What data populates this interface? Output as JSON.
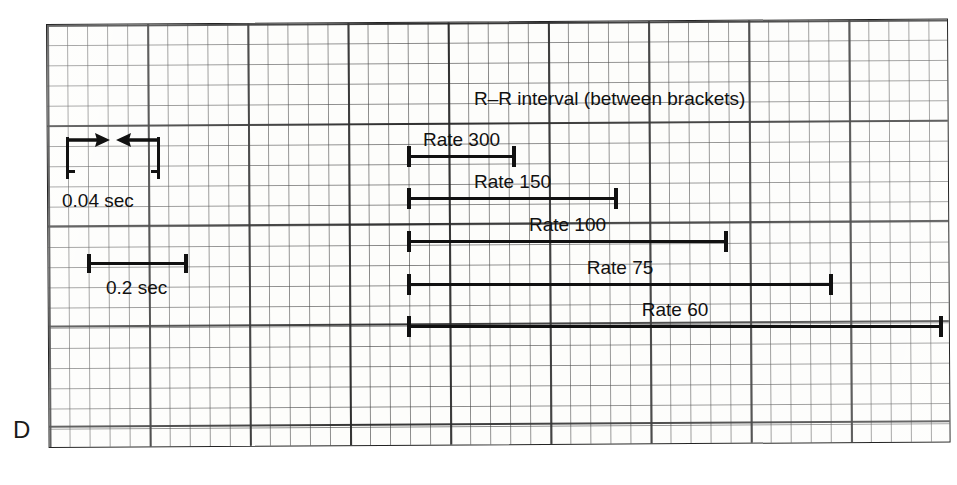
{
  "figure": {
    "panel_letter": "D",
    "title": "R–R interval (between brackets)",
    "background_color": "#ffffff",
    "ink_color": "#111111",
    "grid_color": "#3c3c3c"
  },
  "calibration": {
    "small_box": {
      "label": "0.04 sec",
      "marker_type": "inward-arrows"
    },
    "large_box": {
      "label": "0.2 sec",
      "marker_type": "bracket-bar"
    }
  },
  "chart_data": {
    "type": "bar",
    "title": "R–R interval (between brackets)",
    "xlabel": "Time (ECG paper, 25 mm/sec)",
    "ylabel": "",
    "orientation": "horizontal",
    "categories": [
      "Rate 300",
      "Rate 150",
      "Rate 100",
      "Rate 75",
      "Rate 60"
    ],
    "values": [
      0.2,
      0.4,
      0.6,
      0.8,
      1.0
    ],
    "value_unit": "seconds",
    "grid": true,
    "legend": false,
    "annotations": [
      "0.04 sec",
      "0.2 sec",
      "R–R interval (between brackets)",
      "D"
    ],
    "bars": [
      {
        "label": "Rate 300",
        "rate_bpm": 300,
        "rr_interval_sec": 0.2,
        "large_boxes": 1,
        "small_boxes": 5,
        "x_start_px": 407,
        "x_end_px": 516,
        "y_px": 155
      },
      {
        "label": "Rate 150",
        "rate_bpm": 150,
        "rr_interval_sec": 0.4,
        "large_boxes": 2,
        "small_boxes": 10,
        "x_start_px": 407,
        "x_end_px": 618,
        "y_px": 197
      },
      {
        "label": "Rate 100",
        "rate_bpm": 100,
        "rr_interval_sec": 0.6,
        "large_boxes": 3,
        "small_boxes": 15,
        "x_start_px": 407,
        "x_end_px": 728,
        "y_px": 240
      },
      {
        "label": "Rate 75",
        "rate_bpm": 75,
        "rr_interval_sec": 0.8,
        "large_boxes": 4,
        "small_boxes": 20,
        "x_start_px": 407,
        "x_end_px": 833,
        "y_px": 283
      },
      {
        "label": "Rate 60",
        "rate_bpm": 60,
        "rr_interval_sec": 1.0,
        "large_boxes": 5,
        "small_boxes": 25,
        "x_start_px": 407,
        "x_end_px": 943,
        "y_px": 325
      }
    ]
  }
}
